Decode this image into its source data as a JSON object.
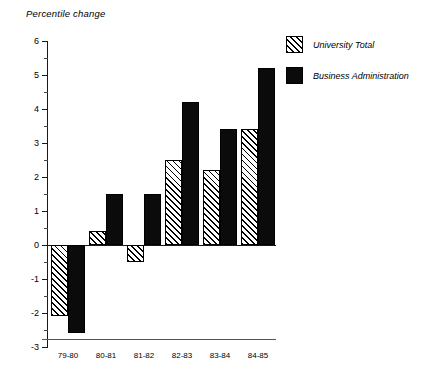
{
  "chart_data": {
    "type": "bar",
    "title": "Percentile change",
    "xlabel": "",
    "ylabel": "",
    "ylim": [
      -3,
      6
    ],
    "ytick_step": 1,
    "yminor_step": 0.5,
    "grid": false,
    "legend_position": "top-right",
    "categories": [
      "79-80",
      "80-81",
      "81-82",
      "82-83",
      "83-84",
      "84-85"
    ],
    "series": [
      {
        "name": "University Total",
        "fill": "diagonal-hatch",
        "values": [
          -2.1,
          0.4,
          -0.5,
          2.5,
          2.2,
          3.4
        ]
      },
      {
        "name": "Business Administration",
        "fill": "solid-black",
        "values": [
          -2.6,
          1.5,
          1.5,
          4.2,
          3.4,
          5.2
        ]
      }
    ],
    "ytick_labels": [
      "6",
      "5",
      "4",
      "3",
      "2",
      "1",
      "0",
      "-1",
      "-2",
      "-3"
    ],
    "ytick_values": [
      6,
      5,
      4,
      3,
      2,
      1,
      0,
      -1,
      -2,
      -3
    ]
  },
  "colors": {
    "series_solid": "#0b0b0b",
    "series_hatch_line": "#000000",
    "axis": "#1a1a1a",
    "background": "#ffffff"
  },
  "legend": {
    "items": [
      {
        "label": "University Total"
      },
      {
        "label": "Business Administration"
      }
    ]
  }
}
